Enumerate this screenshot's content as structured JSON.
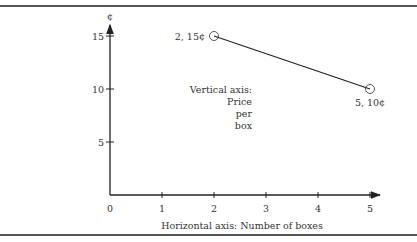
{
  "chart_data": {
    "type": "line",
    "title": "",
    "xlabel": "Horizontal axis: Number of boxes",
    "ylabel_lines": [
      "Vertical axis:",
      "Price",
      "per",
      "box"
    ],
    "y_unit_symbol": "¢",
    "xlim": [
      0,
      5
    ],
    "ylim": [
      0,
      15
    ],
    "x_ticks": [
      0,
      1,
      2,
      3,
      4,
      5
    ],
    "y_ticks": [
      5,
      10,
      15
    ],
    "grid": false,
    "series": [
      {
        "name": "price",
        "points": [
          {
            "x": 2,
            "y": 15,
            "label": "2, 15¢"
          },
          {
            "x": 5,
            "y": 10,
            "label": "5, 10¢"
          }
        ]
      }
    ]
  }
}
